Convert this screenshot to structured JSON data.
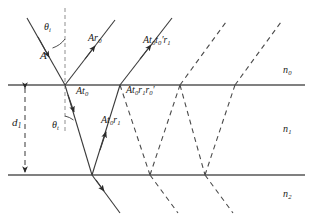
{
  "figure": {
    "colors": {
      "interface_line": "#808080",
      "ray_solid": "#3a3a3a",
      "ray_dashed": "#4a4a4a",
      "normal_dashed": "#9a9a9a",
      "text": "#1a1a1a",
      "background": "#ffffff"
    },
    "media": [
      {
        "name": "medium-n0",
        "label": "n",
        "sub": "0",
        "x": 285,
        "y": 92
      },
      {
        "name": "medium-n1",
        "label": "n",
        "sub": "1",
        "x": 285,
        "y": 130
      },
      {
        "name": "medium-n2",
        "label": "n",
        "sub": "2",
        "x": 285,
        "y": 195
      }
    ],
    "angles": [
      {
        "name": "angle-incident",
        "label": "θ",
        "sub": "i",
        "x": 44,
        "y": 28
      },
      {
        "name": "angle-transmitted",
        "label": "θ",
        "sub": "t",
        "x": 57,
        "y": 126
      }
    ],
    "thickness": {
      "name": "film-thickness",
      "label": "d",
      "sub": "1",
      "x": 14,
      "y": 123
    },
    "ray_labels": [
      {
        "name": "incident-amplitude",
        "text": "A",
        "sub": "",
        "prime_after": "",
        "x": 40,
        "y": 57,
        "size": "lbl-lg"
      },
      {
        "name": "reflected-first",
        "text": "Ar",
        "sub": "0",
        "prime_after": "",
        "x": 88,
        "y": 40,
        "size": "lbl-md"
      },
      {
        "name": "transmitted-out-first",
        "text": "At",
        "sub": "0",
        "prime_after": "t′0r′1",
        "x": 143,
        "y": 42,
        "size": "lbl-md"
      },
      {
        "name": "refracted-into-film",
        "text": "At",
        "sub": "0",
        "prime_after": "",
        "x": 76,
        "y": 93,
        "size": "lbl-md"
      },
      {
        "name": "internal-double-reflection",
        "text": "At",
        "sub": "0",
        "prime_after": "r′1r′′0",
        "x": 126,
        "y": 92,
        "size": "lbl-md"
      },
      {
        "name": "internal-reflected-first",
        "text": "At",
        "sub": "0",
        "prime_after": "r′1",
        "x": 101,
        "y": 122,
        "size": "lbl-md"
      }
    ],
    "interfaces": [
      {
        "name": "interface-n0-n1",
        "y": 85
      },
      {
        "name": "interface-n1-n2",
        "y": 175
      }
    ],
    "geometry": {
      "entry_x": 65,
      "top_hits": [
        65,
        120,
        180,
        235
      ],
      "bottom_hits": [
        92,
        150,
        205
      ]
    }
  }
}
